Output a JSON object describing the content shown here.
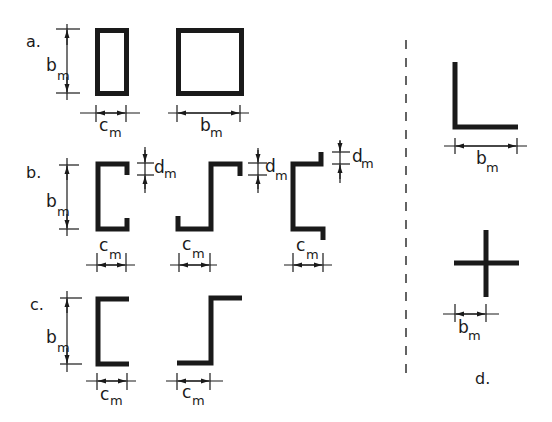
{
  "figure": {
    "sections": [
      {
        "label": "a.",
        "shapes": [
          "rectangular hollow section",
          "square hollow section"
        ],
        "dims": [
          {
            "sym": "b",
            "sub": "m"
          },
          {
            "sym": "c",
            "sub": "m"
          },
          {
            "sym": "b",
            "sub": "m"
          }
        ]
      },
      {
        "label": "b.",
        "shapes": [
          "lipped channel",
          "lipped Z-section",
          "lipped Z-section (inward lips)"
        ],
        "dims": [
          {
            "sym": "b",
            "sub": "m"
          },
          {
            "sym": "d",
            "sub": "m"
          },
          {
            "sym": "c",
            "sub": "m"
          }
        ]
      },
      {
        "label": "c.",
        "shapes": [
          "plain channel",
          "plain Z-section"
        ],
        "dims": [
          {
            "sym": "b",
            "sub": "m"
          },
          {
            "sym": "c",
            "sub": "m"
          }
        ]
      },
      {
        "label": "d.",
        "shapes": [
          "angle section",
          "cruciform section"
        ],
        "dims": [
          {
            "sym": "b",
            "sub": "m"
          }
        ]
      }
    ]
  },
  "labels": {
    "a": "a.",
    "b": "b.",
    "c": "c.",
    "d": "d.",
    "b_sym": "b",
    "c_sym": "c",
    "d_sym": "d",
    "m_sub": "m"
  },
  "colors": {
    "ink": "#1a1a1a",
    "background": "#ffffff"
  }
}
